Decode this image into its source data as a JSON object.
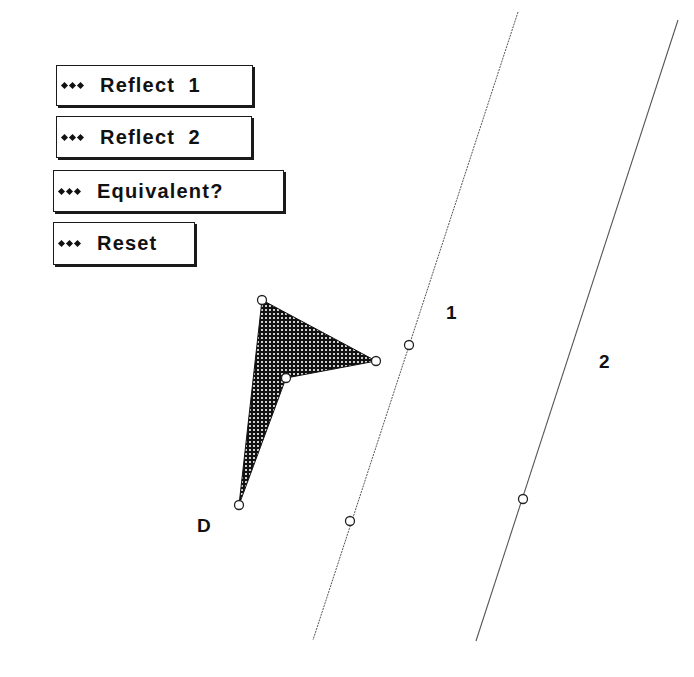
{
  "buttons": [
    {
      "id": "reflect-1",
      "label": "Reflect  1",
      "left": 56,
      "top": 65,
      "width": 197,
      "height": 41
    },
    {
      "id": "reflect-2",
      "label": "Reflect  2",
      "left": 56,
      "top": 116,
      "width": 196,
      "height": 42
    },
    {
      "id": "equivalent",
      "label": "Equivalent?",
      "left": 53,
      "top": 170,
      "width": 231,
      "height": 42
    },
    {
      "id": "reset",
      "label": "Reset",
      "left": 53,
      "top": 222,
      "width": 142,
      "height": 43
    }
  ],
  "bullet_icon": "three-diamonds",
  "labels": {
    "line1": "1",
    "line2": "2",
    "point_d": "D"
  },
  "lines": [
    {
      "name": "mirror-line-1",
      "x1": 518,
      "y1": 12,
      "x2": 313,
      "y2": 640
    },
    {
      "name": "mirror-line-2",
      "x1": 678,
      "y1": 20,
      "x2": 476,
      "y2": 641
    }
  ],
  "shape": {
    "name": "dart-quadrilateral",
    "fill": "dotted-black",
    "vertices": [
      [
        262,
        300
      ],
      [
        376,
        361
      ],
      [
        286,
        378
      ],
      [
        239,
        505
      ]
    ]
  },
  "points": [
    {
      "name": "vertex-top",
      "x": 262,
      "y": 300
    },
    {
      "name": "vertex-right",
      "x": 376,
      "y": 361
    },
    {
      "name": "vertex-inner",
      "x": 286,
      "y": 378
    },
    {
      "name": "vertex-d",
      "x": 239,
      "y": 505
    },
    {
      "name": "line1-point-upper",
      "x": 409,
      "y": 345
    },
    {
      "name": "line1-point-lower",
      "x": 350,
      "y": 521
    },
    {
      "name": "line2-point",
      "x": 523,
      "y": 499
    }
  ],
  "colors": {
    "ink": "#111111",
    "line": "#555555",
    "background": "#ffffff"
  }
}
